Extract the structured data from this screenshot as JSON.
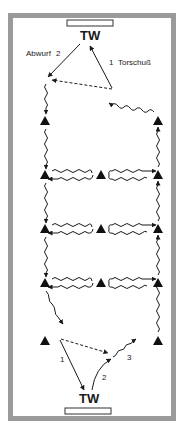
{
  "diagram": {
    "type": "handball drill field diagram",
    "frame_color": "#9a9a9a",
    "line_color": "#1a1a1a",
    "top_goalkeeper": {
      "label": "TW"
    },
    "bottom_goalkeeper": {
      "label": "TW"
    },
    "top_labels": {
      "throw_out": "Abwurf",
      "throw_out_number": "2",
      "shot_number": "1",
      "shot": "Torschuß"
    },
    "bottom_labels": {
      "pass_number": "1",
      "throw_number": "2",
      "dribble_number": "3"
    },
    "cones": [
      {
        "row": 0,
        "positions": [
          "left",
          "right"
        ]
      },
      {
        "row": 1,
        "positions": [
          "left",
          "center",
          "right"
        ]
      },
      {
        "row": 2,
        "positions": [
          "left",
          "center",
          "right"
        ]
      },
      {
        "row": 3,
        "positions": [
          "left",
          "center",
          "right"
        ]
      },
      {
        "row": 4,
        "positions": [
          "left",
          "right"
        ]
      }
    ]
  }
}
